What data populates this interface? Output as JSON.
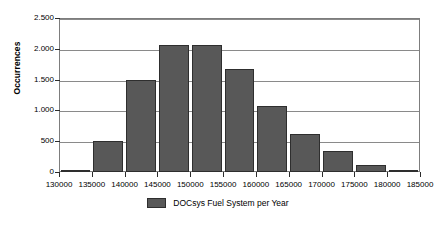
{
  "chart_data": {
    "type": "bar",
    "title": "",
    "subtitle": "",
    "xlabel": "",
    "ylabel": "Occurrences",
    "xlim": [
      130000,
      185000
    ],
    "ylim": [
      0,
      2500
    ],
    "grid": true,
    "legend_position": "bottom-center",
    "y_ticks": [
      {
        "value": 0,
        "label": "0"
      },
      {
        "value": 500,
        "label": "500"
      },
      {
        "value": 1000,
        "label": "1.000"
      },
      {
        "value": 1500,
        "label": "1.500"
      },
      {
        "value": 2000,
        "label": "2.000"
      },
      {
        "value": 2500,
        "label": "2.500"
      }
    ],
    "x_ticks": [
      {
        "value": 130000,
        "label": "130000"
      },
      {
        "value": 135000,
        "label": "135000"
      },
      {
        "value": 140000,
        "label": "140000"
      },
      {
        "value": 145000,
        "label": "145000"
      },
      {
        "value": 150000,
        "label": "150000"
      },
      {
        "value": 155000,
        "label": "155000"
      },
      {
        "value": 160000,
        "label": "160000"
      },
      {
        "value": 165000,
        "label": "165000"
      },
      {
        "value": 170000,
        "label": "170000"
      },
      {
        "value": 175000,
        "label": "175000"
      },
      {
        "value": 180000,
        "label": "180000"
      },
      {
        "value": 185000,
        "label": "185000"
      }
    ],
    "bin_edges": [
      130000,
      135000,
      140000,
      145000,
      150000,
      155000,
      160000,
      165000,
      170000,
      175000,
      180000,
      185000
    ],
    "categories": [
      "130000-135000",
      "135000-140000",
      "140000-145000",
      "145000-150000",
      "150000-155000",
      "155000-160000",
      "160000-165000",
      "165000-170000",
      "170000-175000",
      "175000-180000",
      "180000-185000"
    ],
    "values": [
      10,
      505,
      1490,
      2055,
      2055,
      1670,
      1070,
      620,
      335,
      115,
      35
    ],
    "series": [
      {
        "name": "DOCsys Fuel System per Year",
        "color": "#585858",
        "values": [
          10,
          505,
          1490,
          2055,
          2055,
          1670,
          1070,
          620,
          335,
          115,
          35
        ]
      }
    ],
    "legend": [
      {
        "label": "DOCsys Fuel System per Year",
        "color": "#585858"
      }
    ]
  },
  "colors": {
    "bar_fill": "#585858",
    "bar_edge": "#2e2e2e",
    "gridline": "#8a8a8a",
    "frame": "#7d7d7d",
    "background": "#ffffff",
    "text": "#000000"
  }
}
